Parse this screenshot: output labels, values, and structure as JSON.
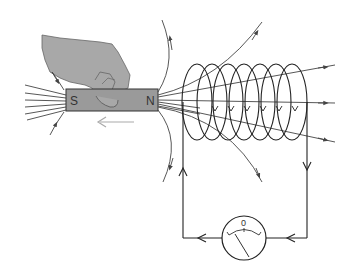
{
  "diagram": {
    "type": "electromagnetic-induction",
    "magnet": {
      "south_label": "S",
      "north_label": "N",
      "fill": "#9a9a9a",
      "motion_direction": "left"
    },
    "galvanometer": {
      "scale_label": "0"
    },
    "colors": {
      "line": "#333333",
      "hand": "#a8a8a8",
      "arrow_grey": "#aaaaaa"
    },
    "coil": {
      "turns": 7
    }
  }
}
